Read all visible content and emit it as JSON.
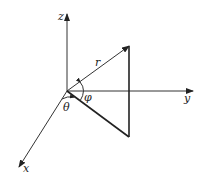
{
  "figure": {
    "type": "spherical-coordinates-diagram",
    "origin": [
      67,
      91
    ],
    "axes": [
      {
        "name": "z",
        "label": "z",
        "end": [
          67,
          14
        ],
        "label_pos": [
          58,
          20
        ]
      },
      {
        "name": "y",
        "label": "y",
        "end": [
          193,
          91
        ],
        "label_pos": [
          184,
          102
        ]
      },
      {
        "name": "x",
        "label": "x",
        "end": [
          19,
          167
        ],
        "label_pos": [
          23,
          172
        ]
      }
    ],
    "vector": {
      "label": "r",
      "end": [
        129,
        46
      ],
      "label_pos": [
        95,
        66
      ]
    },
    "triangle_points": {
      "top": [
        129,
        46
      ],
      "bottom": [
        129,
        137
      ]
    },
    "angles": [
      {
        "name": "phi",
        "label": "φ",
        "label_pos": [
          84,
          101
        ]
      },
      {
        "name": "theta",
        "label": "θ",
        "label_pos": [
          63,
          111
        ]
      }
    ],
    "colors": {
      "stroke": "#333333",
      "background": "#ffffff"
    }
  }
}
